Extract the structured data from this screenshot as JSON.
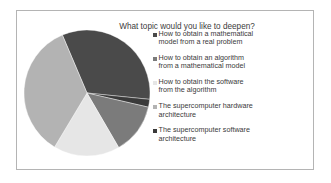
{
  "chart_data": {
    "type": "pie",
    "title": "What topic would you like to deepen?",
    "legend_position": "right",
    "categories": [
      "How to obtain a mathematical model from a real problem",
      "How to obtain an algorithm from a mathematical model",
      "How to obtain the software from the algorithm",
      "The supercomputer hardware architecture",
      "The supercomputer software architecture"
    ],
    "values": [
      33,
      13,
      17,
      35,
      2
    ],
    "colors": [
      "#4a4a4a",
      "#7b7b7b",
      "#e6e6e6",
      "#b3b3b3",
      "#3a3a3a"
    ]
  },
  "legend": [
    {
      "line1": "How to obtain a mathematical",
      "line2": "model from a real problem"
    },
    {
      "line1": "How to obtain an algorithm",
      "line2": "from a mathematical model"
    },
    {
      "line1": "How to obtain the software",
      "line2": "from the algorithm"
    },
    {
      "line1": "The supercomputer hardware",
      "line2": "architecture"
    },
    {
      "line1": "The supercomputer software",
      "line2": "architecture"
    }
  ]
}
